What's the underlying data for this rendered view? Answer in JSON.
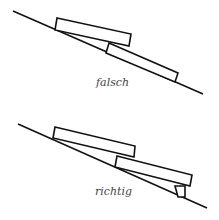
{
  "diagram": {
    "panels": [
      {
        "label": "falsch"
      },
      {
        "label": "richtig"
      }
    ]
  }
}
